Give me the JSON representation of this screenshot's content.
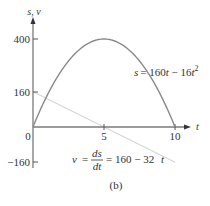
{
  "chart_data": {
    "type": "line",
    "title": "",
    "caption": "(b)",
    "xlabel": "t",
    "ylabel": "s, v",
    "xlim": [
      0,
      10.5
    ],
    "ylim": [
      -160,
      420
    ],
    "x_ticks": [
      0,
      5,
      10
    ],
    "x_tick_labels": [
      "0",
      "5",
      "10"
    ],
    "y_ticks": [
      400,
      160,
      -160
    ],
    "y_tick_labels": [
      "400",
      "160",
      "-160"
    ],
    "grid": false,
    "legend": null,
    "series": [
      {
        "name": "s = 160t - 16t^2",
        "label": "s = 160t − 16t²",
        "color": "#8a8a8a",
        "x": [
          0,
          1,
          2,
          3,
          4,
          5,
          6,
          7,
          8,
          9,
          10
        ],
        "values": [
          0,
          144,
          256,
          336,
          384,
          400,
          384,
          336,
          256,
          144,
          0
        ]
      },
      {
        "name": "v = ds/dt = 160 - 32t",
        "label": "v = ds/dt = 160 − 32t",
        "color": "#d0d0d0",
        "x": [
          0,
          5,
          10
        ],
        "values": [
          160,
          0,
          -160
        ]
      }
    ],
    "annotations": [
      "s = 160t − 16t²",
      "v = ds/dt = 160 − 32t"
    ]
  },
  "labels": {
    "y_axis": "s, v",
    "x_axis": "t",
    "tick_400": "400",
    "tick_160": "160",
    "tick_neg160": "−160",
    "tick_0": "0",
    "tick_5": "5",
    "tick_10": "10",
    "s_eq_lhs": "s",
    "s_eq_rhs": "= 160",
    "s_eq_t": "t",
    "s_eq_minus": " − 16",
    "s_eq_t2": "t",
    "s_eq_sup": "2",
    "v_eq_v": "v",
    "v_eq_equals": "=",
    "v_eq_ds": "ds",
    "v_eq_dt": "dt",
    "v_eq_rhs": "= 160 − 32",
    "v_eq_t": "t",
    "caption": "(b)"
  }
}
